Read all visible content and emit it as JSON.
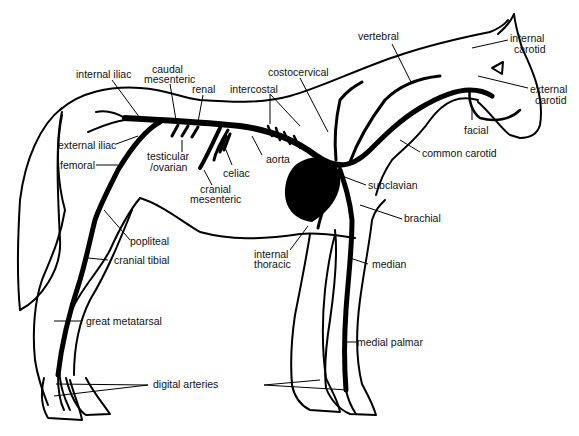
{
  "colors": {
    "line": "#000000",
    "background": "#ffffff",
    "text": "#111111"
  },
  "labels": {
    "internal_iliac": "internal iliac",
    "caudal_mesenteric": [
      "caudal",
      "mesenteric"
    ],
    "renal": "renal",
    "intercostal": "intercostal",
    "costocervical": "costocervical",
    "vertebral": "vertebral",
    "internal_carotid": [
      "internal",
      "carotid"
    ],
    "external_carotid": [
      "external",
      "carotid"
    ],
    "facial": "facial",
    "common_carotid": "common carotid",
    "external_iliac": "external iliac",
    "femoral": "femoral",
    "testicular_ovarian": [
      "testicular",
      "/ovarian"
    ],
    "celiac": "celiac",
    "aorta": "aorta",
    "cranial_mesenteric": [
      "cranial",
      "mesenteric"
    ],
    "subclavian": "subclavian",
    "brachial": "brachial",
    "popliteal": "popliteal",
    "cranial_tibial": "cranial tibial",
    "internal_thoracic": [
      "internal",
      "thoracic"
    ],
    "median": "median",
    "great_metatarsal": "great metatarsal",
    "medial_palmar": "medial palmar",
    "digital_arteries": "digital arteries"
  }
}
